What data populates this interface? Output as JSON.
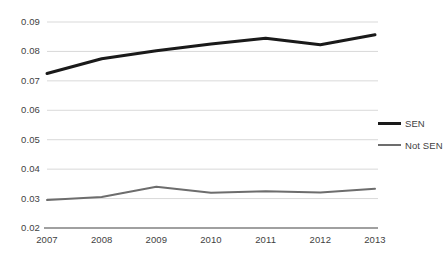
{
  "chart_data": {
    "type": "line",
    "title": "",
    "subtitle": "",
    "xlabel": "",
    "ylabel": "",
    "categories": [
      "2007",
      "2008",
      "2009",
      "2010",
      "2011",
      "2012",
      "2013"
    ],
    "x_tick_labels": [
      "2007",
      "2008",
      "2009",
      "2010",
      "2011",
      "2012",
      "2013"
    ],
    "y_tick_labels": [
      "0.09",
      "0.08",
      "0.07",
      "0.06",
      "0.05",
      "0.04",
      "0.03",
      "0.02"
    ],
    "y_tick_values": [
      0.09,
      0.08,
      0.07,
      0.06,
      0.05,
      0.04,
      0.03,
      0.02
    ],
    "ylim": [
      0.02,
      0.09
    ],
    "grid": true,
    "grid_axis": "y",
    "grid_color": "#d9d9d9",
    "axis_line_color": "#808080",
    "legend_position": "right",
    "series": [
      {
        "name": "SEN",
        "color": "#1a1a1a",
        "line_width": 3,
        "values": [
          0.0725,
          0.0775,
          0.0802,
          0.0825,
          0.0845,
          0.0823,
          0.0857
        ]
      },
      {
        "name": "Not SEN",
        "color": "#6d6d6d",
        "line_width": 2,
        "values": [
          0.0295,
          0.0305,
          0.034,
          0.032,
          0.0325,
          0.0321,
          0.0333
        ]
      }
    ]
  },
  "legend": {
    "items": [
      {
        "label": "SEN"
      },
      {
        "label": "Not SEN"
      }
    ]
  }
}
